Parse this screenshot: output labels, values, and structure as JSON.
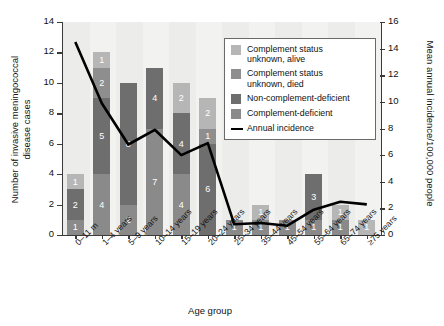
{
  "chart_data": {
    "type": "bar",
    "title": "",
    "xlabel": "Age group",
    "ylabel": "Number of invasive meningococcal disease cases",
    "ylabel_right": "Mean annual incidence/100,000 people",
    "ylim": [
      0,
      14
    ],
    "ylim_right": [
      0,
      16
    ],
    "yticks": [
      0,
      2,
      4,
      6,
      8,
      10,
      12,
      14
    ],
    "yticks_right": [
      0,
      2,
      4,
      6,
      8,
      10,
      12,
      14,
      16
    ],
    "grid": false,
    "legend_position": "upper-right-inside",
    "categories": [
      "0–11 m",
      "1–4 years",
      "5–9 years",
      "10–14 years",
      "15–19 years",
      "20–24 years",
      "25–34 years",
      "35–44 years",
      "45–54 years",
      "55–64 years",
      "65–74 years",
      "≥75 years"
    ],
    "series": [
      {
        "name": "Complement status unknown, alive",
        "color": "#b6b6b6",
        "values": [
          1,
          1,
          0,
          0,
          2,
          2,
          0,
          1,
          0,
          0,
          1,
          1
        ]
      },
      {
        "name": "Complement status unknown, died",
        "color": "#8e8e8e",
        "values": [
          0,
          2,
          0,
          0,
          0,
          1,
          0,
          0,
          0,
          0,
          0,
          0
        ]
      },
      {
        "name": "Non-complement-deficient",
        "color": "#6e6e6e",
        "values": [
          2,
          5,
          8,
          4,
          4,
          6,
          0,
          0,
          0,
          3,
          0,
          0
        ]
      },
      {
        "name": "Complement-deficient",
        "color": "#8a8a8a",
        "values": [
          1,
          4,
          2,
          7,
          4,
          0,
          1,
          1,
          1,
          1,
          1,
          0
        ]
      }
    ],
    "bar_totals": [
      4,
      12,
      10,
      11,
      10,
      9,
      1,
      2,
      1,
      4,
      2,
      1
    ],
    "line_series": {
      "name": "Annual incidence",
      "color": "#000000",
      "values": [
        14.5,
        9.9,
        6.8,
        7.9,
        6.0,
        6.9,
        0.8,
        0.9,
        0.7,
        1.9,
        2.5,
        2.3
      ]
    },
    "segment_labels": [
      [
        {
          "v": "1",
          "s": "alive"
        },
        {
          "v": "2",
          "s": "noncd"
        },
        {
          "v": "1",
          "s": "cd"
        }
      ],
      [
        {
          "v": "1",
          "s": "alive"
        },
        {
          "v": "2",
          "s": "died"
        },
        {
          "v": "5",
          "s": "noncd"
        },
        {
          "v": "4",
          "s": "cd"
        }
      ],
      [
        {
          "v": "8",
          "s": "noncd"
        },
        {
          "v": "2",
          "s": "cd"
        }
      ],
      [
        {
          "v": "4",
          "s": "noncd"
        },
        {
          "v": "7",
          "s": "cd"
        }
      ],
      [
        {
          "v": "2",
          "s": "alive"
        },
        {
          "v": "4",
          "s": "noncd"
        },
        {
          "v": "4",
          "s": "cd"
        }
      ],
      [
        {
          "v": "2",
          "s": "alive"
        },
        {
          "v": "1",
          "s": "died"
        },
        {
          "v": "6",
          "s": "noncd"
        }
      ],
      [
        {
          "v": "1",
          "s": "cd"
        }
      ],
      [
        {
          "v": "1",
          "s": "alive"
        },
        {
          "v": "1",
          "s": "cd"
        }
      ],
      [
        {
          "v": "1",
          "s": "cd"
        }
      ],
      [
        {
          "v": "3",
          "s": "noncd"
        },
        {
          "v": "1",
          "s": "cd"
        }
      ],
      [
        {
          "v": "1",
          "s": "alive"
        },
        {
          "v": "1",
          "s": "cd"
        }
      ],
      [
        {
          "v": "1",
          "s": "alive"
        }
      ]
    ]
  },
  "legend": {
    "items": [
      {
        "label_line1": "Complement status",
        "label_line2": "unknown, alive",
        "color": "#b6b6b6",
        "type": "swatch"
      },
      {
        "label_line1": "Complement status",
        "label_line2": "unknown, died",
        "color": "#8e8e8e",
        "type": "swatch"
      },
      {
        "label_line1": "Non-complement-deficient",
        "label_line2": "",
        "color": "#6e6e6e",
        "type": "swatch"
      },
      {
        "label_line1": "Complement-deficient",
        "label_line2": "",
        "color": "#8a8a8a",
        "type": "swatch"
      },
      {
        "label_line1": "Annual incidence",
        "label_line2": "",
        "color": "#000000",
        "type": "line"
      }
    ]
  }
}
